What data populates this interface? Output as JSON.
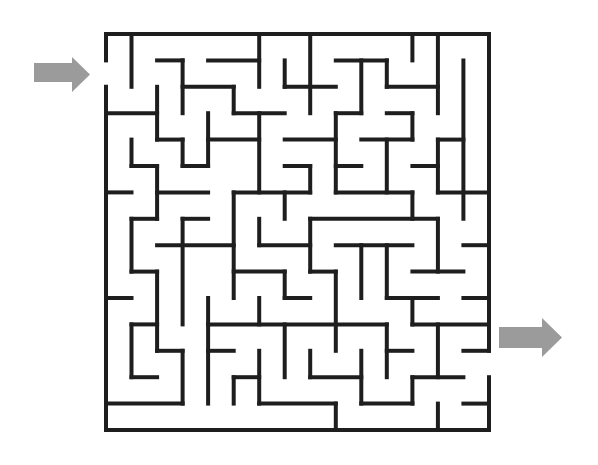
{
  "maze": {
    "title": "Maze",
    "grid": {
      "cols": 15,
      "rows": 15,
      "origin_x": 106,
      "origin_y": 34,
      "cell_w": 25.53,
      "cell_h": 26.4
    },
    "wall_color": "#1e1e1e",
    "arrow_color": "#9b9b9b",
    "entrance": {
      "label": "Start",
      "side": "left",
      "row": 1,
      "icon": "arrow-right-icon"
    },
    "exit": {
      "label": "Finish",
      "side": "right",
      "row": 12,
      "icon": "arrow-right-icon"
    },
    "horizontal_walls": [
      [
        0,
        0,
        15
      ],
      [
        1,
        2,
        3
      ],
      [
        1,
        4,
        6
      ],
      [
        1,
        9,
        11
      ],
      [
        2,
        3,
        5
      ],
      [
        2,
        7,
        9
      ],
      [
        2,
        11,
        13
      ],
      [
        3,
        0,
        2
      ],
      [
        3,
        5,
        7
      ],
      [
        3,
        9,
        10
      ],
      [
        3,
        11,
        12
      ],
      [
        4,
        2,
        3
      ],
      [
        4,
        4,
        6
      ],
      [
        4,
        7,
        9
      ],
      [
        4,
        10,
        12
      ],
      [
        4,
        13,
        14
      ],
      [
        5,
        1,
        2
      ],
      [
        5,
        3,
        4
      ],
      [
        5,
        7,
        8
      ],
      [
        5,
        9,
        10
      ],
      [
        5,
        12,
        13
      ],
      [
        6,
        0,
        1
      ],
      [
        6,
        2,
        4
      ],
      [
        6,
        5,
        8
      ],
      [
        6,
        9,
        12
      ],
      [
        6,
        13,
        15
      ],
      [
        7,
        1,
        2
      ],
      [
        7,
        3,
        4
      ],
      [
        7,
        8,
        13
      ],
      [
        8,
        2,
        5
      ],
      [
        8,
        6,
        8
      ],
      [
        8,
        9,
        12
      ],
      [
        8,
        14,
        15
      ],
      [
        9,
        1,
        2
      ],
      [
        9,
        5,
        7
      ],
      [
        9,
        8,
        9
      ],
      [
        9,
        12,
        14
      ],
      [
        10,
        0,
        1
      ],
      [
        10,
        7,
        8
      ],
      [
        10,
        11,
        13
      ],
      [
        10,
        14,
        15
      ],
      [
        11,
        1,
        2
      ],
      [
        11,
        4,
        11
      ],
      [
        11,
        12,
        15
      ],
      [
        12,
        2,
        3
      ],
      [
        12,
        4,
        5
      ],
      [
        12,
        11,
        12
      ],
      [
        12,
        14,
        15
      ],
      [
        13,
        1,
        2
      ],
      [
        13,
        5,
        6
      ],
      [
        13,
        8,
        10
      ],
      [
        13,
        12,
        14
      ],
      [
        14,
        0,
        3
      ],
      [
        14,
        6,
        9
      ],
      [
        14,
        10,
        12
      ],
      [
        14,
        14,
        15
      ],
      [
        15,
        0,
        15
      ]
    ],
    "vertical_walls": [
      [
        0,
        0,
        1
      ],
      [
        0,
        2,
        15
      ],
      [
        1,
        0,
        2
      ],
      [
        1,
        4,
        5
      ],
      [
        1,
        7,
        9
      ],
      [
        1,
        11,
        13
      ],
      [
        2,
        2,
        4
      ],
      [
        2,
        5,
        7
      ],
      [
        2,
        9,
        12
      ],
      [
        3,
        1,
        3
      ],
      [
        3,
        4,
        5
      ],
      [
        3,
        7,
        11
      ],
      [
        3,
        12,
        14
      ],
      [
        4,
        3,
        5
      ],
      [
        4,
        10,
        14
      ],
      [
        5,
        2,
        3
      ],
      [
        5,
        6,
        10
      ],
      [
        5,
        13,
        14
      ],
      [
        6,
        0,
        2
      ],
      [
        6,
        3,
        6
      ],
      [
        6,
        7,
        8
      ],
      [
        6,
        10,
        11
      ],
      [
        6,
        12,
        14
      ],
      [
        7,
        1,
        2
      ],
      [
        7,
        6,
        7
      ],
      [
        7,
        9,
        10
      ],
      [
        7,
        11,
        13
      ],
      [
        8,
        0,
        3
      ],
      [
        8,
        5,
        6
      ],
      [
        8,
        7,
        9
      ],
      [
        8,
        12,
        13
      ],
      [
        9,
        3,
        6
      ],
      [
        9,
        9,
        12
      ],
      [
        9,
        14,
        15
      ],
      [
        10,
        1,
        3
      ],
      [
        10,
        8,
        10
      ],
      [
        10,
        12,
        14
      ],
      [
        11,
        1,
        2
      ],
      [
        11,
        4,
        6
      ],
      [
        11,
        8,
        10
      ],
      [
        11,
        11,
        13
      ],
      [
        12,
        0,
        1
      ],
      [
        12,
        3,
        4
      ],
      [
        12,
        6,
        7
      ],
      [
        12,
        10,
        11
      ],
      [
        12,
        13,
        14
      ],
      [
        13,
        0,
        3
      ],
      [
        13,
        4,
        6
      ],
      [
        13,
        7,
        9
      ],
      [
        13,
        11,
        13
      ],
      [
        13,
        14,
        15
      ],
      [
        14,
        1,
        7
      ],
      [
        15,
        0,
        12
      ],
      [
        15,
        13,
        15
      ]
    ]
  }
}
